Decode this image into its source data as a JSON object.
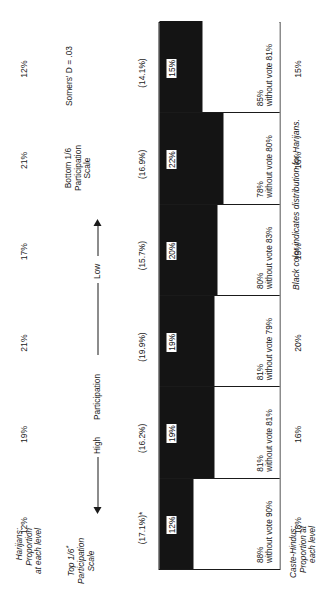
{
  "figure": {
    "footnote": "Black color indicates distribution for Harijans.",
    "statistic": "Somers' D = .03"
  },
  "top_axis": {
    "title_line1": "Harijans:",
    "title_line2": "Proportion",
    "title_line3": "at each level"
  },
  "bottom_axis": {
    "title_line1": "Caste-Hindus:",
    "title_line2": "Proportion at",
    "title_line3": "each level"
  },
  "scale": {
    "top_line1": "Top 1/6",
    "top_line2": "Participation",
    "top_line3": "Scale",
    "top_star": "*",
    "high_label": "High",
    "middle_label": "Participation",
    "low_label": "Low",
    "bottom_line1": "Bottom 1/6",
    "bottom_line2": "Participation",
    "bottom_line3": "Scale"
  },
  "chart_data": {
    "type": "bar",
    "title": "",
    "subtitle": "",
    "xlabel": "Participation Scale",
    "ylabel": "Proportion",
    "ylim": [
      0,
      100
    ],
    "grid": false,
    "legend_position": "none",
    "categories": [
      "Top 1/6 Participation Scale",
      "Level 2",
      "Level 3",
      "Level 4",
      "Level 5",
      "Bottom 1/6 Participation Scale"
    ],
    "series": [
      {
        "name": "Harijans (black)",
        "values": [
          12,
          19,
          19,
          20,
          22,
          15
        ]
      },
      {
        "name": "Caste-Hindus (white)",
        "values": [
          88,
          81,
          81,
          80,
          78,
          85
        ]
      }
    ],
    "annotations": {
      "harijans_proportion_at_each_level": [
        "12%",
        "19%",
        "21%",
        "17%",
        "21%",
        "12%"
      ],
      "parenthetical": [
        "(17.1%)*",
        "(16.2%)",
        "(19.9%)",
        "(15.7%)",
        "(16.9%)",
        "(14.1%)"
      ],
      "black_segment_labels": [
        "12%",
        "19%",
        "19%",
        "20%",
        "22%",
        "15%"
      ],
      "white_segment_pct": [
        "88%",
        "81%",
        "81%",
        "80%",
        "78%",
        "85%"
      ],
      "white_segment_note": [
        "without vote 90%",
        "without vote 81%",
        "without vote 79%",
        "without vote 83%",
        "without vote 80%",
        "without vote 81%"
      ],
      "caste_hindus_proportion_at_each_level": [
        "18%",
        "16%",
        "20%",
        "15%",
        "16%",
        "15%"
      ]
    }
  }
}
